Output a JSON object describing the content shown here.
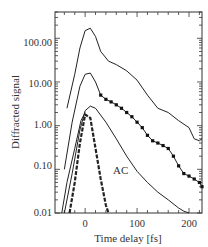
{
  "chart_data": {
    "type": "line",
    "title": "",
    "xlabel": "Time delay [fs]",
    "ylabel": "Diffracted signal",
    "yscale": "log",
    "xlim": [
      -58,
      225
    ],
    "ylim": [
      0.01,
      400
    ],
    "grid": false,
    "x_ticks": [
      0,
      100,
      200
    ],
    "x_tick_labels": [
      "0",
      "100",
      "200"
    ],
    "y_ticks": [
      0.01,
      0.1,
      1,
      10,
      100
    ],
    "y_tick_labels": [
      "0.01",
      "0.10",
      "1.00",
      "10.00",
      "100.00"
    ],
    "annotations": [
      {
        "text": "AC",
        "x": 55,
        "y": 0.14
      }
    ],
    "series": [
      {
        "name": "top",
        "style": "solid",
        "x": [
          -35,
          -20,
          -10,
          0,
          10,
          20,
          30,
          45,
          60,
          80,
          100,
          120,
          140,
          160,
          180,
          200,
          210,
          220,
          225
        ],
        "y": [
          2.5,
          15,
          60,
          150,
          170,
          110,
          50,
          30,
          25,
          18,
          11,
          5,
          2.5,
          2,
          1.3,
          0.9,
          0.5,
          0.45,
          0.5
        ]
      },
      {
        "name": "second",
        "style": "solid",
        "x": [
          -40,
          -25,
          -10,
          0,
          10,
          20,
          30
        ],
        "y": [
          0.1,
          1.2,
          8,
          15,
          16,
          10,
          5
        ]
      },
      {
        "name": "second-markers",
        "style": "markers",
        "x": [
          30,
          40,
          50,
          60,
          70,
          80,
          90,
          100,
          110,
          120,
          130,
          140,
          150,
          160,
          170,
          180,
          190,
          200,
          210,
          220,
          225
        ],
        "y": [
          5,
          4,
          3.5,
          3,
          2.5,
          2,
          1.6,
          1.2,
          0.9,
          0.6,
          0.45,
          0.4,
          0.35,
          0.3,
          0.2,
          0.12,
          0.08,
          0.07,
          0.06,
          0.05,
          0.04
        ]
      },
      {
        "name": "third",
        "style": "solid",
        "x": [
          -40,
          -25,
          -10,
          0,
          10,
          20,
          40,
          60,
          80,
          100,
          120,
          140,
          160,
          180,
          190,
          200
        ],
        "y": [
          0.01,
          0.08,
          0.8,
          2.2,
          2.8,
          2.5,
          1.2,
          0.5,
          0.2,
          0.09,
          0.05,
          0.03,
          0.02,
          0.013,
          0.011,
          0.01
        ]
      },
      {
        "name": "AC",
        "style": "dashed-heavy",
        "x": [
          -30,
          -20,
          -10,
          0,
          10,
          20,
          30,
          40,
          45
        ],
        "y": [
          0.01,
          0.05,
          0.4,
          1.8,
          1.5,
          0.3,
          0.06,
          0.015,
          0.01
        ]
      },
      {
        "name": "AC-left-thin",
        "style": "solid",
        "x": [
          -45,
          -35,
          -20,
          -8,
          0
        ],
        "y": [
          0.01,
          0.05,
          0.3,
          1.3,
          2
        ]
      }
    ]
  },
  "labels": {
    "xlabel": "Time delay [fs]",
    "ylabel": "Diffracted signal",
    "ac": "AC",
    "xt0": "0",
    "xt100": "100",
    "xt200": "200",
    "yt100": "100.00",
    "yt10": "10.00",
    "yt1": "1.00",
    "yt01": "0.10",
    "yt001": "0.01"
  }
}
